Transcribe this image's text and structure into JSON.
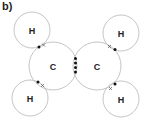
{
  "figure": {
    "part_label": "b)",
    "atoms": [
      {
        "id": "H1",
        "symbol": "H",
        "cx": 32,
        "cy": 30,
        "r": 18
      },
      {
        "id": "H2",
        "symbol": "H",
        "cx": 30,
        "cy": 98,
        "r": 18
      },
      {
        "id": "C1",
        "symbol": "C",
        "cx": 53,
        "cy": 66,
        "r": 24
      },
      {
        "id": "C2",
        "symbol": "C",
        "cx": 97,
        "cy": 66,
        "r": 24
      },
      {
        "id": "H3",
        "symbol": "H",
        "cx": 121,
        "cy": 33,
        "r": 18
      },
      {
        "id": "H4",
        "symbol": "H",
        "cx": 121,
        "cy": 99,
        "r": 18
      }
    ],
    "bonds": [
      {
        "between": [
          "H1",
          "C1"
        ],
        "type": "single",
        "electrons": [
          "dot",
          "cross"
        ]
      },
      {
        "between": [
          "H2",
          "C1"
        ],
        "type": "single",
        "electrons": [
          "dot",
          "cross"
        ]
      },
      {
        "between": [
          "C1",
          "C2"
        ],
        "type": "double",
        "electrons": [
          "dot",
          "dot",
          "dot",
          "dot"
        ]
      },
      {
        "between": [
          "H3",
          "C2"
        ],
        "type": "single",
        "electrons": [
          "cross",
          "dot"
        ]
      },
      {
        "between": [
          "H4",
          "C2"
        ],
        "type": "single",
        "electrons": [
          "cross",
          "dot"
        ]
      }
    ],
    "colors": {
      "shell_stroke": "#bdbdbd",
      "electron": "#111111",
      "text": "#222222"
    }
  }
}
